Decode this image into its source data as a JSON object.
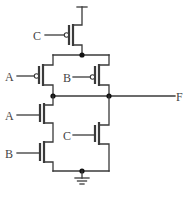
{
  "diagram": {
    "type": "CMOS logic gate schematic",
    "inputs": {
      "pmos_top": "C",
      "pmos_left": "A",
      "pmos_right": "B",
      "nmos_top": "A",
      "nmos_bottom": "B",
      "nmos_right": "C"
    },
    "output": "F",
    "colors": {
      "wire": "#3a3a3a",
      "node": "#111111",
      "label": "#444444"
    }
  }
}
